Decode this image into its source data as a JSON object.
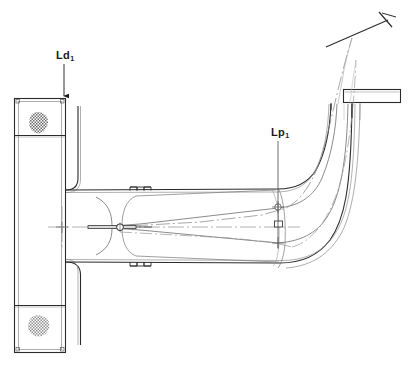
{
  "diagram": {
    "type": "technical-line-drawing",
    "canvas": {
      "width": 411,
      "height": 365
    },
    "background_color": "#ffffff",
    "line_color": "#2b2b2b",
    "thin_line_color": "#555555",
    "centerline_color": "#777777"
  },
  "labels": [
    {
      "id": "ld1",
      "base_text": "Ld",
      "subscript": "1",
      "x": 56,
      "y": 50,
      "leader": {
        "from_x": 64,
        "from_y": 64,
        "to_x": 64,
        "to_y": 97,
        "arrow": "down"
      },
      "meaning": "duct-length-dimension-1"
    },
    {
      "id": "lp1",
      "base_text": "Lp",
      "subscript": "1",
      "x": 271,
      "y": 127,
      "leader": {
        "from_x": 278,
        "from_y": 141,
        "to_x": 278,
        "to_y": 248,
        "arrow": "none"
      },
      "meaning": "pipe-length-dimension-1"
    }
  ],
  "elements": {
    "wall_section": {
      "name": "left-wall-section",
      "x": 14,
      "y": 98,
      "width": 52,
      "height": 255,
      "dividers_y": [
        135,
        305
      ]
    },
    "hatch_blobs": [
      {
        "name": "masonry-hatch-top",
        "cx": 38,
        "cy": 124,
        "rx": 10,
        "ry": 9
      },
      {
        "name": "masonry-hatch-bottom",
        "cx": 38,
        "cy": 327,
        "rx": 11,
        "ry": 9
      }
    ],
    "ceiling_slab": {
      "name": "ceiling-slab",
      "x": 343,
      "y": 89,
      "width": 58,
      "height": 14
    },
    "pivot_marker": {
      "name": "pivot-circle",
      "cx": 120,
      "cy": 228,
      "r": 3.2
    },
    "center_cross_marks": [
      {
        "cx": 62,
        "cy": 227
      },
      {
        "cx": 278,
        "cy": 207
      },
      {
        "cx": 278,
        "cy": 243
      }
    ],
    "flange_details": [
      {
        "name": "flange-upper",
        "x": 130,
        "y": 188,
        "width": 22,
        "height": 6
      },
      {
        "name": "flange-lower",
        "x": 130,
        "y": 256,
        "width": 22,
        "height": 7
      }
    ],
    "axis_tick": {
      "name": "axis-terminator-tick",
      "x1": 380,
      "y1": 14,
      "x2": 392,
      "y2": 28,
      "leader_x1": 326,
      "leader_y1": 47,
      "leader_x2": 386,
      "leader_y2": 21
    }
  }
}
